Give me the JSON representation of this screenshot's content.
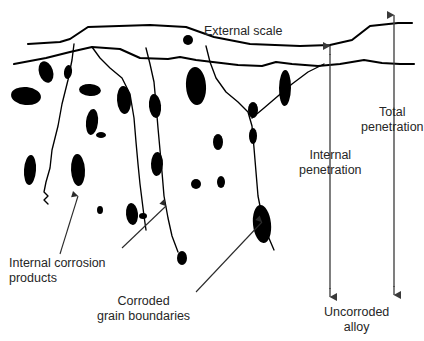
{
  "figure": {
    "background_color": "#ffffff",
    "line_color": "#000000",
    "text_color": "#262626",
    "precipitate_color": "#000000"
  },
  "labels": {
    "external_scale": "External scale",
    "total_penetration_line1": "Total",
    "total_penetration_line2": "penetration",
    "internal_penetration_line1": "Internal",
    "internal_penetration_line2": "penetration",
    "internal_corrosion_line1": "Internal corrosion",
    "internal_corrosion_line2": "products",
    "corroded_gb_line1": "Corroded",
    "corroded_gb_line2": "grain boundaries",
    "uncorroded_alloy_line1": "Uncorroded",
    "uncorroded_alloy_line2": "alloy"
  },
  "measure_arrows": [
    {
      "name": "total-penetration",
      "x": 394,
      "y_top": 14,
      "y_bottom": 296,
      "double_headed": true
    },
    {
      "name": "internal-penetration",
      "x": 330,
      "y_top": 45,
      "y_bottom": 298,
      "double_headed": true
    }
  ],
  "boundaries": {
    "outer_scale_surface": "M 28,44 L 60,42 L 70,39 L 88,27 L 150,25 L 186,27 L 214,37 L 250,44 L 300,46 L 330,45 L 352,40 L 370,26 L 398,23 L 412,23",
    "inner_metal_surface": "M 14,64 L 46,58 L 70,52 L 92,47 L 120,49 L 140,58 L 168,59 L 180,57 L 196,60 L 238,65 L 262,66 L 276,62 L 292,64 L 318,66 L 340,64 L 364,60 L 382,63 L 400,64 L 414,64"
  },
  "grain_boundary_cracks": [
    {
      "name": "crack-left",
      "path": "M 74,44 L 72,60 L 68,80 L 62,104 L 58,126 L 52,150 L 50,168 L 46,182 L 44,192 L 48,196 L 44,200 L 48,204"
    },
    {
      "name": "crack-mid-left",
      "path": "M 92,47 L 100,58 L 110,68 L 122,78 L 130,94 L 134,118 L 136,142 L 138,164 L 140,184 L 142,200 L 144,216 L 146,230"
    },
    {
      "name": "crack-mid",
      "path": "M 146,48 L 150,64 L 154,82 L 156,104 L 158,128 L 160,150 L 162,172 L 164,196 L 168,218 L 172,236 L 178,252"
    },
    {
      "name": "crack-right-branch",
      "path": "M 206,46 L 210,62 L 216,78 L 226,92 L 238,102 L 248,112 L 252,126 L 254,148 L 256,172 L 258,196 L 262,216 L 268,236 L 274,250"
    },
    {
      "name": "crack-right-tail",
      "path": "M 252,118 L 264,108 L 278,96 L 292,84 L 308,72 L 324,64"
    }
  ],
  "leader_arrows": [
    {
      "name": "leader-internal-corrosion",
      "path": "M 60,254 L 78,196",
      "target": "precipitate"
    },
    {
      "name": "leader-corroded-gb-1",
      "path": "M 122,248 L 166,206",
      "target": "precipitate"
    },
    {
      "name": "leader-corroded-gb-2",
      "path": "M 196,292 L 262,222",
      "target": "grain-boundary"
    }
  ],
  "precipitates": [
    {
      "cx": 46,
      "cy": 72,
      "rx": 7,
      "ry": 11,
      "rot": -18
    },
    {
      "cx": 26,
      "cy": 96,
      "rx": 15,
      "ry": 9,
      "rot": 6
    },
    {
      "cx": 68,
      "cy": 72,
      "rx": 4,
      "ry": 7,
      "rot": 8
    },
    {
      "cx": 90,
      "cy": 90,
      "rx": 11,
      "ry": 6,
      "rot": 4
    },
    {
      "cx": 92,
      "cy": 122,
      "rx": 6,
      "ry": 13,
      "rot": 6
    },
    {
      "cx": 124,
      "cy": 100,
      "rx": 7,
      "ry": 14,
      "rot": -4
    },
    {
      "cx": 101,
      "cy": 135,
      "rx": 5,
      "ry": 3,
      "rot": 0
    },
    {
      "cx": 30,
      "cy": 170,
      "rx": 6,
      "ry": 15,
      "rot": 4
    },
    {
      "cx": 78,
      "cy": 170,
      "rx": 7,
      "ry": 16,
      "rot": -3
    },
    {
      "cx": 196,
      "cy": 86,
      "rx": 10,
      "ry": 19,
      "rot": -4
    },
    {
      "cx": 155,
      "cy": 106,
      "rx": 6,
      "ry": 12,
      "rot": -6
    },
    {
      "cx": 157,
      "cy": 164,
      "rx": 6,
      "ry": 12,
      "rot": 2
    },
    {
      "cx": 100,
      "cy": 210,
      "rx": 3,
      "ry": 4,
      "rot": 0
    },
    {
      "cx": 132,
      "cy": 214,
      "rx": 6,
      "ry": 11,
      "rot": -6
    },
    {
      "cx": 182,
      "cy": 258,
      "rx": 5,
      "ry": 7,
      "rot": 0
    },
    {
      "cx": 218,
      "cy": 142,
      "rx": 5,
      "ry": 8,
      "rot": 0
    },
    {
      "cx": 221,
      "cy": 182,
      "rx": 4,
      "ry": 6,
      "rot": 0
    },
    {
      "cx": 262,
      "cy": 224,
      "rx": 9,
      "ry": 19,
      "rot": -6
    },
    {
      "cx": 285,
      "cy": 88,
      "rx": 6,
      "ry": 18,
      "rot": 1
    },
    {
      "cx": 253,
      "cy": 110,
      "rx": 5,
      "ry": 8,
      "rot": 0
    },
    {
      "cx": 253,
      "cy": 136,
      "rx": 4,
      "ry": 8,
      "rot": 0
    },
    {
      "cx": 196,
      "cy": 184,
      "rx": 5,
      "ry": 5,
      "rot": 0
    },
    {
      "cx": 188,
      "cy": 40,
      "rx": 5,
      "ry": 5,
      "rot": 0
    },
    {
      "cx": 143,
      "cy": 216,
      "rx": 4,
      "ry": 3,
      "rot": 0
    }
  ]
}
